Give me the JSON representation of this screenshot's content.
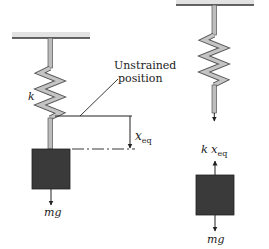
{
  "figure": {
    "left_panel": {
      "spring_label": "k",
      "unstrained_label_line1": "Unstrained",
      "unstrained_label_line2": "position",
      "displacement_label_main": "x",
      "displacement_label_sub": "eq",
      "weight_label": "mg"
    },
    "right_panel": {
      "spring_force_label_k": "k",
      "spring_force_label_x": "x",
      "spring_force_label_sub": "eq",
      "weight_label": "mg"
    },
    "colors": {
      "ceiling_fill": "#d9d9d9",
      "ceiling_edge": "#333333",
      "spring_fill": "#bdbdbd",
      "spring_edge": "#444444",
      "block_fill": "#3a3a3a",
      "line": "#222222"
    }
  }
}
